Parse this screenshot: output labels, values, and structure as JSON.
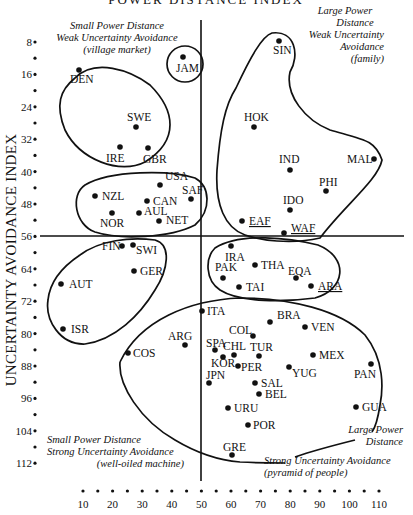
{
  "chart_data": {
    "type": "scatter",
    "title": "POWER DISTANCE INDEX",
    "xlabel": "POWER DISTANCE INDEX",
    "ylabel": "UNCERTAINTY AVOIDANCE INDEX",
    "xlim": [
      5,
      115
    ],
    "ylim": [
      4,
      116
    ],
    "y_inverted": true,
    "grid": false,
    "x_ticks": [
      10,
      20,
      30,
      40,
      50,
      60,
      70,
      80,
      90,
      100,
      110
    ],
    "y_ticks": [
      8,
      16,
      24,
      32,
      40,
      48,
      56,
      64,
      72,
      80,
      88,
      96,
      104,
      112
    ],
    "divider_lines": {
      "x": 50,
      "y": 56
    },
    "points": [
      {
        "label": "JAM",
        "x": 45,
        "y": 13,
        "underline": false
      },
      {
        "label": "SIN",
        "x": 77,
        "y": 8,
        "underline": false
      },
      {
        "label": "DEN",
        "x": 18,
        "y": 23,
        "underline": false
      },
      {
        "label": "SWE",
        "x": 31,
        "y": 29,
        "underline": false
      },
      {
        "label": "IRE",
        "x": 28,
        "y": 35,
        "underline": false
      },
      {
        "label": "GBR",
        "x": 35,
        "y": 35,
        "underline": false
      },
      {
        "label": "HOK",
        "x": 68,
        "y": 29,
        "underline": false
      },
      {
        "label": "IND",
        "x": 77,
        "y": 40,
        "underline": false
      },
      {
        "label": "MAL",
        "x": 104,
        "y": 36,
        "underline": false
      },
      {
        "label": "PHI",
        "x": 94,
        "y": 44,
        "underline": false
      },
      {
        "label": "USA",
        "x": 40,
        "y": 46,
        "underline": false
      },
      {
        "label": "NZL",
        "x": 22,
        "y": 49,
        "underline": false
      },
      {
        "label": "SAF",
        "x": 49,
        "y": 49,
        "underline": false
      },
      {
        "label": "CAN",
        "x": 39,
        "y": 48,
        "underline": false
      },
      {
        "label": "AUL",
        "x": 36,
        "y": 51,
        "underline": false
      },
      {
        "label": "NOR",
        "x": 31,
        "y": 50,
        "underline": false
      },
      {
        "label": "NET",
        "x": 38,
        "y": 53,
        "underline": false
      },
      {
        "label": "IDO",
        "x": 78,
        "y": 48,
        "underline": false
      },
      {
        "label": "EAF",
        "x": 64,
        "y": 52,
        "underline": true
      },
      {
        "label": "WAF",
        "x": 77,
        "y": 54,
        "underline": true
      },
      {
        "label": "FIN",
        "x": 33,
        "y": 59,
        "underline": false
      },
      {
        "label": "SWI",
        "x": 34,
        "y": 58,
        "underline": false
      },
      {
        "label": "GER",
        "x": 35,
        "y": 65,
        "underline": false
      },
      {
        "label": "AUT",
        "x": 11,
        "y": 70,
        "underline": false
      },
      {
        "label": "ISR",
        "x": 13,
        "y": 81,
        "underline": false
      },
      {
        "label": "IRA",
        "x": 58,
        "y": 59,
        "underline": false
      },
      {
        "label": "PAK",
        "x": 55,
        "y": 70,
        "underline": false
      },
      {
        "label": "THA",
        "x": 64,
        "y": 64,
        "underline": false
      },
      {
        "label": "TAI",
        "x": 58,
        "y": 69,
        "underline": false
      },
      {
        "label": "EQA",
        "x": 78,
        "y": 67,
        "underline": false
      },
      {
        "label": "ARA",
        "x": 80,
        "y": 68,
        "underline": true
      },
      {
        "label": "ITA",
        "x": 50,
        "y": 75,
        "underline": false
      },
      {
        "label": "BRA",
        "x": 69,
        "y": 76,
        "underline": false
      },
      {
        "label": "VEN",
        "x": 81,
        "y": 76,
        "underline": false
      },
      {
        "label": "COL",
        "x": 67,
        "y": 80,
        "underline": false
      },
      {
        "label": "ARG",
        "x": 49,
        "y": 86,
        "underline": false
      },
      {
        "label": "COS",
        "x": 35,
        "y": 86,
        "underline": false
      },
      {
        "label": "SPA",
        "x": 57,
        "y": 86,
        "underline": false
      },
      {
        "label": "CHL",
        "x": 63,
        "y": 86,
        "underline": false
      },
      {
        "label": "TUR",
        "x": 66,
        "y": 85,
        "underline": false
      },
      {
        "label": "KOR",
        "x": 60,
        "y": 85,
        "underline": false
      },
      {
        "label": "MEX",
        "x": 81,
        "y": 82,
        "underline": false
      },
      {
        "label": "PER",
        "x": 64,
        "y": 87,
        "underline": false
      },
      {
        "label": "YUG",
        "x": 76,
        "y": 88,
        "underline": false
      },
      {
        "label": "PAN",
        "x": 95,
        "y": 86,
        "underline": false
      },
      {
        "label": "JPN",
        "x": 54,
        "y": 92,
        "underline": false
      },
      {
        "label": "SAL",
        "x": 66,
        "y": 94,
        "underline": false
      },
      {
        "label": "BEL",
        "x": 65,
        "y": 94,
        "underline": false
      },
      {
        "label": "URU",
        "x": 61,
        "y": 100,
        "underline": false
      },
      {
        "label": "GUA",
        "x": 95,
        "y": 101,
        "underline": false
      },
      {
        "label": "POR",
        "x": 63,
        "y": 104,
        "underline": false
      },
      {
        "label": "GRE",
        "x": 60,
        "y": 112,
        "underline": false
      }
    ],
    "quadrant_annotations": [
      {
        "lines": [
          "Small Power Distance",
          "Weak Uncertainty Avoidance",
          "(village market)"
        ]
      },
      {
        "lines": [
          "Large Power",
          "Distance",
          "Weak Uncertainty",
          "Avoidance",
          "(family)"
        ]
      },
      {
        "lines": [
          "Small Power Distance",
          "Strong Uncertainty Avoidance",
          "(well-oiled machine)"
        ]
      },
      {
        "lines": [
          "Large Power",
          "Distance"
        ]
      },
      {
        "lines": [
          "Strong Uncertainty Avoidance",
          "(pyramid of people)"
        ]
      }
    ],
    "legend": null
  },
  "layout_px": {
    "points": [
      [
        183,
        57
      ],
      [
        279,
        41
      ],
      [
        79,
        70
      ],
      [
        136,
        127
      ],
      [
        120,
        147
      ],
      [
        148,
        148
      ],
      [
        254,
        127
      ],
      [
        290,
        170
      ],
      [
        374,
        159
      ],
      [
        326,
        191
      ],
      [
        160,
        185
      ],
      [
        95,
        196
      ],
      [
        191,
        199
      ],
      [
        147,
        201
      ],
      [
        139,
        213
      ],
      [
        112,
        213
      ],
      [
        159,
        221
      ],
      [
        290,
        210
      ],
      [
        242,
        221
      ],
      [
        284,
        233
      ],
      [
        122,
        246
      ],
      [
        133,
        245
      ],
      [
        134,
        271
      ],
      [
        61,
        284
      ],
      [
        63,
        329
      ],
      [
        231,
        246
      ],
      [
        223,
        278
      ],
      [
        255,
        265
      ],
      [
        239,
        287
      ],
      [
        296,
        278
      ],
      [
        311,
        286
      ],
      [
        202,
        311
      ],
      [
        270,
        322
      ],
      [
        305,
        327
      ],
      [
        253,
        336
      ],
      [
        185,
        345
      ],
      [
        128,
        353
      ],
      [
        215,
        350
      ],
      [
        234,
        355
      ],
      [
        259,
        356
      ],
      [
        223,
        357
      ],
      [
        313,
        355
      ],
      [
        238,
        366
      ],
      [
        289,
        367
      ],
      [
        371,
        364
      ],
      [
        209,
        383
      ],
      [
        255,
        383
      ],
      [
        259,
        394
      ],
      [
        228,
        408
      ],
      [
        356,
        407
      ],
      [
        248,
        425
      ],
      [
        232,
        455
      ]
    ],
    "labels": [
      [
        176,
        72,
        "start"
      ],
      [
        273,
        54,
        "start"
      ],
      [
        70,
        83,
        "start"
      ],
      [
        127,
        121,
        "start"
      ],
      [
        106,
        162,
        "start"
      ],
      [
        143,
        163,
        "start"
      ],
      [
        244,
        121,
        "start"
      ],
      [
        279,
        163,
        "start"
      ],
      [
        347,
        163,
        "start"
      ],
      [
        319,
        186,
        "start"
      ],
      [
        165,
        180,
        "start"
      ],
      [
        102,
        200,
        "start"
      ],
      [
        182,
        194,
        "start"
      ],
      [
        153,
        205,
        "start"
      ],
      [
        144,
        215,
        "start"
      ],
      [
        100,
        227,
        "start"
      ],
      [
        166,
        224,
        "start"
      ],
      [
        283,
        204,
        "start"
      ],
      [
        249,
        225,
        "start"
      ],
      [
        291,
        232,
        "start"
      ],
      [
        102,
        250,
        "start"
      ],
      [
        136,
        254,
        "start"
      ],
      [
        140,
        275,
        "start"
      ],
      [
        69,
        288,
        "start"
      ],
      [
        71,
        333,
        "start"
      ],
      [
        225,
        261,
        "start"
      ],
      [
        215,
        271,
        "start"
      ],
      [
        261,
        269,
        "start"
      ],
      [
        246,
        291,
        "start"
      ],
      [
        288,
        275,
        "start"
      ],
      [
        318,
        290,
        "start"
      ],
      [
        207,
        315,
        "start"
      ],
      [
        277,
        319,
        "start"
      ],
      [
        311,
        331,
        "start"
      ],
      [
        229,
        334,
        "start"
      ],
      [
        168,
        340,
        "start"
      ],
      [
        133,
        357,
        "start"
      ],
      [
        206,
        347,
        "start"
      ],
      [
        223,
        350,
        "start"
      ],
      [
        250,
        351,
        "start"
      ],
      [
        211,
        367,
        "start"
      ],
      [
        319,
        359,
        "start"
      ],
      [
        241,
        371,
        "start"
      ],
      [
        292,
        377,
        "start"
      ],
      [
        354,
        378,
        "start"
      ],
      [
        206,
        379,
        "start"
      ],
      [
        261,
        387,
        "start"
      ],
      [
        265,
        398,
        "start"
      ],
      [
        234,
        412,
        "start"
      ],
      [
        362,
        411,
        "start"
      ],
      [
        253,
        429,
        "start"
      ],
      [
        223,
        451,
        "start"
      ]
    ]
  }
}
